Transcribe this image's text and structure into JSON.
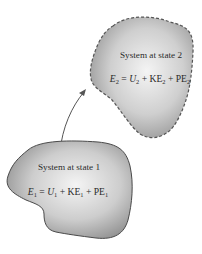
{
  "diagram": {
    "type": "process-state-change",
    "state2": {
      "title": "System at state 2",
      "equation": {
        "lhs": "E",
        "lhs_sub": "2",
        "eq": " = ",
        "t1": "U",
        "t1_sub": "2",
        "plus1": " + ",
        "t2": "KE",
        "t2_sub": "2",
        "plus2": " + ",
        "t3": "PE",
        "t3_sub": "2"
      },
      "boundary_style": "dashed"
    },
    "state1": {
      "title": "System at state 1",
      "equation": {
        "lhs": "E",
        "lhs_sub": "1",
        "eq": " = ",
        "t1": "U",
        "t1_sub": "1",
        "plus1": " + ",
        "t2": "KE",
        "t2_sub": "1",
        "plus2": " + ",
        "t3": "PE",
        "t3_sub": "1"
      },
      "boundary_style": "solid"
    },
    "arrow": {
      "from": "state1",
      "to": "state2"
    },
    "colors": {
      "fill_light": "#f2f2f2",
      "fill_dark": "#8c8c8c",
      "outline": "#555555",
      "text": "#2a2a2a"
    }
  }
}
